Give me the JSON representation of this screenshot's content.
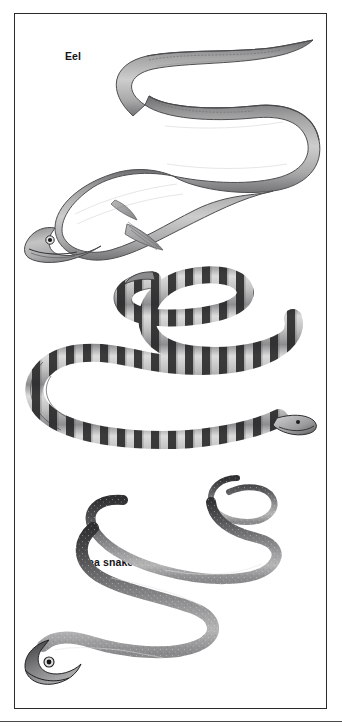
{
  "plate": {
    "kind": "comparative-anatomy-illustration-plate",
    "background_color": "#ffffff",
    "frame_color": "#2b2b2e",
    "ink_color": "#3a3a3d",
    "label_color": "#141416"
  },
  "figures": [
    {
      "id": "eel",
      "label": "Eel",
      "description": "Grayscale illustration of an eel in an S-shaped curve, head at lower left with a dark round eye, pointed snout, long mouth line, a pectoral fin behind the gill, and a long tapering body with a continuous dorsal fin fold running to the tail at upper right.",
      "orientation": "head-lower-left",
      "body_shading": "smooth-gradient-gray",
      "markings": "none",
      "fill_light": "#cfcfcf",
      "fill_mid": "#9a9a9a",
      "fill_dark": "#5a5a5c"
    },
    {
      "id": "sea-snake",
      "label": "Sea snake",
      "description": "Grayscale illustration of a banded sea snake coiled in a double S-curve, head at lower right, body ringed with alternating dark bands and pale gray bands, paddle-shaped flattened tail at upper left.",
      "orientation": "head-lower-right",
      "body_shading": "banded",
      "markings": "dark transverse bands",
      "band_count": 34,
      "fill_light": "#d8d8d8",
      "fill_mid": "#8e8e8e",
      "fill_dark": "#232325"
    },
    {
      "id": "ophiderpeton",
      "label": "Ophiderpeton",
      "description": "Grayscale illustration of Ophiderpeton, an extinct limbless amphibian, in a long winding S-curve; head at lower left with a large pale-rimmed eye, body dark gray and finely speckled with a paler underside, slender tail curling at upper right.",
      "orientation": "head-lower-left",
      "body_shading": "dark-speckled",
      "markings": "fine light speckling",
      "fill_light": "#c2c2c2",
      "fill_mid": "#6f6f71",
      "fill_dark": "#2e2e30"
    }
  ]
}
